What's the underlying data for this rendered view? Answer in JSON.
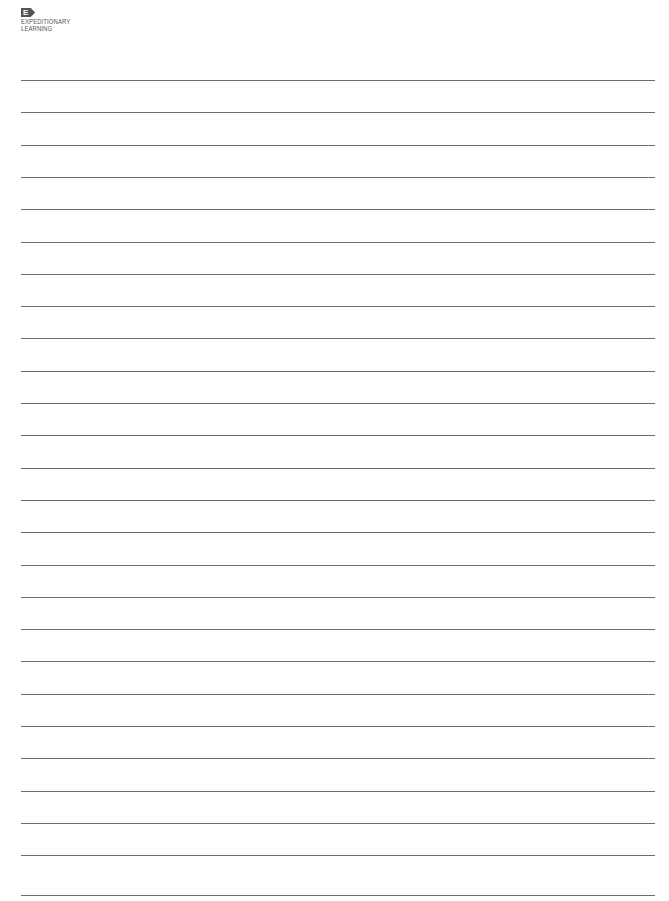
{
  "logo": {
    "mark": "E",
    "line1": "EXPEDITIONARY",
    "line2": "LEARNING",
    "color": "#555555"
  },
  "page": {
    "type": "lined-paper",
    "line_color": "#6e6e6e",
    "line_count": 26,
    "line_left": 21,
    "line_right": 655,
    "first_line_y": 80,
    "line_spacing": 32.3,
    "last_line_y": 895
  }
}
